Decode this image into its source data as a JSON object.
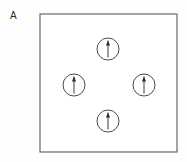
{
  "figure": {
    "panel_label": "A",
    "caption_text": "",
    "background_color": "#fefefe"
  },
  "enclosure": {
    "name": "material-boundary-box",
    "x": 40,
    "y": 14,
    "width": 137,
    "height": 138,
    "stroke_color": "#5a5a5a",
    "fill_color": "#ffffff",
    "stroke_width": 1.1
  },
  "chart_data": {
    "type": "scatter",
    "title": "",
    "xlabel": "",
    "ylabel": "",
    "grid": false,
    "legend": null,
    "xlim": [
      40,
      177
    ],
    "ylim": [
      14,
      152
    ],
    "annotations": [
      "A"
    ],
    "series": [
      {
        "name": "magnetic-domains",
        "marker": "circle-with-up-arrow",
        "radius": 11,
        "arrow_direction_degrees": 90,
        "points": [
          {
            "label": "domain-top",
            "x": 108,
            "y": 49,
            "arrow": "up"
          },
          {
            "label": "domain-left",
            "x": 74,
            "y": 85,
            "arrow": "up"
          },
          {
            "label": "domain-right",
            "x": 144,
            "y": 85,
            "arrow": "up"
          },
          {
            "label": "domain-bottom",
            "x": 108,
            "y": 121,
            "arrow": "up"
          }
        ]
      }
    ]
  },
  "colors": {
    "box_stroke": "#5a5a5a",
    "circle_stroke": "#4a4a4a",
    "arrow_fill": "#2e2e2e",
    "label_text": "#2b2b2b"
  }
}
